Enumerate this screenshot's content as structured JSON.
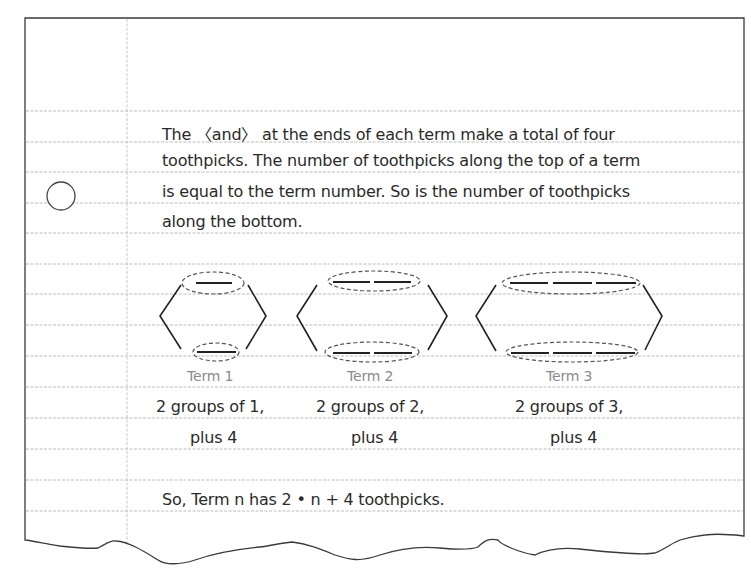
{
  "page": {
    "border_color": "#3a3a3a",
    "rule_color": "#b8b8b8",
    "margin_color": "#c4c4c4",
    "text_color": "#2a2a2a",
    "term_label_color": "#8a8a8a"
  },
  "paragraph": {
    "lines": [
      "The 〈and〉 at the ends of each term make a total of four",
      "toothpicks. The number of toothpicks along the top of a term",
      "is equal to the term number. So is the number of toothpicks",
      "along the bottom."
    ]
  },
  "terms": [
    {
      "label": "Term 1",
      "caption_line1": "2 groups of 1,",
      "caption_line2": "plus 4",
      "top_toothpicks": 1,
      "bottom_toothpicks": 1
    },
    {
      "label": "Term 2",
      "caption_line1": "2 groups of 2,",
      "caption_line2": "plus 4",
      "top_toothpicks": 2,
      "bottom_toothpicks": 2
    },
    {
      "label": "Term 3",
      "caption_line1": "2 groups of 3,",
      "caption_line2": "plus 4",
      "top_toothpicks": 3,
      "bottom_toothpicks": 3
    }
  ],
  "conclusion": "So, Term n has 2 • n + 4 toothpicks."
}
